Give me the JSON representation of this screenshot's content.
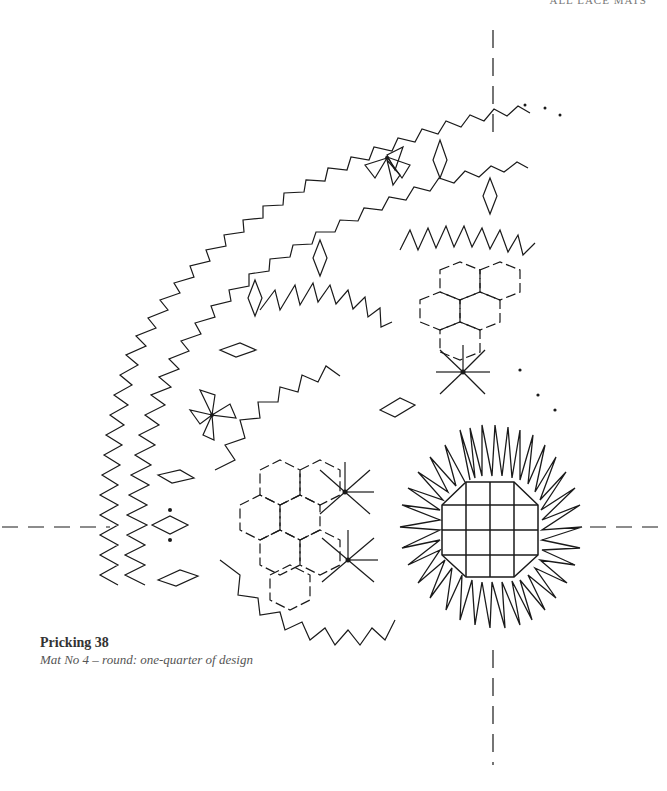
{
  "page": {
    "running_head": "ALL LACE MATS"
  },
  "figure": {
    "type": "bobbin-lace-pricking",
    "axis_lines": {
      "vertical_x": 493,
      "horizontal_y": 525,
      "style": "dashed"
    },
    "colors": {
      "line": "#1a1a1a",
      "background": "#ffffff"
    }
  },
  "caption": {
    "title": "Pricking 38",
    "subtitle": "Mat No 4 – round: one-quarter of design"
  }
}
